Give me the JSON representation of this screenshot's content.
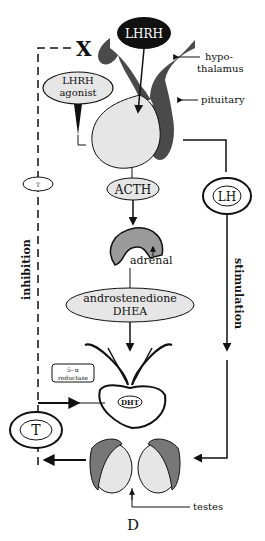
{
  "diagram": {
    "panel_letter": "D",
    "nodes": {
      "lhrh": "LHRH",
      "lhrh_agonist_line1": "LHRH",
      "lhrh_agonist_line2": "agonist",
      "acth": "ACTH",
      "lh": "LH",
      "androgens_line1": "androstenedione",
      "androgens_line2": "DHEA",
      "reductase_line1": "5- α",
      "reductase_line2": "reductase",
      "dht": "DHT",
      "testosterone": "T",
      "small_t": "T"
    },
    "labels": {
      "hypothalamus_line1": "hypo-",
      "hypothalamus_line2": "thalamus",
      "pituitary": "pituitary",
      "adrenal": "adrenal",
      "testes": "testes",
      "inhibition": "inhibition",
      "stimulation": "stimulation"
    },
    "block_mark": "X",
    "colors": {
      "ink": "#111111",
      "dark_tissue": "#4a4a4a",
      "light_fill": "#e6e6e6",
      "mid_fill": "#9a9a9a"
    }
  }
}
